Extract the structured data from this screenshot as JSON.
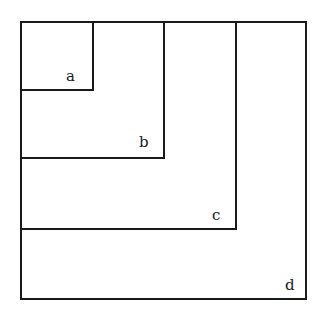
{
  "diagram": {
    "type": "nested-squares",
    "stroke_color": "#1a1a1a",
    "background": "#ffffff",
    "squares": [
      {
        "label": "a",
        "left": 20,
        "top": 21,
        "right": 93,
        "bottom": 90
      },
      {
        "label": "b",
        "left": 20,
        "top": 21,
        "right": 164,
        "bottom": 158
      },
      {
        "label": "c",
        "left": 20,
        "top": 21,
        "right": 236,
        "bottom": 229
      },
      {
        "label": "d",
        "left": 20,
        "top": 21,
        "right": 306,
        "bottom": 299
      }
    ]
  }
}
